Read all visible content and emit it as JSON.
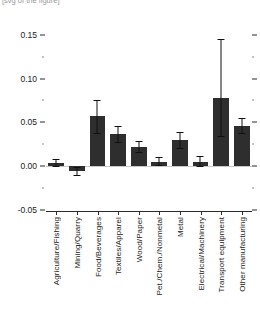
{
  "supertitle": "[svg of the figure]",
  "chart_data": {
    "type": "bar",
    "title": "",
    "xlabel": "",
    "ylabel": "",
    "ylim": [
      -0.05,
      0.16
    ],
    "grid": false,
    "legend": null,
    "orientation": "vertical",
    "error_bars": true,
    "baseline": 0.0,
    "categories": [
      "Agriculture/Fishing",
      "Mining/Quarry",
      "Food/Beverages",
      "Textiles/Apparel",
      "Wood/Paper",
      "Pet./Chem./Nonmetal",
      "Metal",
      "Electrical/Machinery",
      "Transport equipment",
      "Other manufacturing"
    ],
    "values": [
      0.004,
      -0.005,
      0.057,
      0.037,
      0.022,
      0.005,
      0.03,
      0.005,
      0.078,
      0.046
    ],
    "err_low": [
      0.0,
      -0.01,
      0.038,
      0.028,
      0.016,
      0.001,
      0.021,
      0.0,
      0.035,
      0.038
    ],
    "err_high": [
      0.008,
      -0.001,
      0.075,
      0.046,
      0.029,
      0.01,
      0.039,
      0.012,
      0.145,
      0.055
    ],
    "yticks_major": [
      -0.05,
      0.0,
      0.05,
      0.1,
      0.15
    ],
    "yticks_major_labels": [
      "-0.05",
      "0.00",
      "0.05",
      "0.10",
      "0.15"
    ],
    "yticks_minor": [
      -0.025,
      0.025,
      0.075,
      0.125
    ],
    "bar_color": "#2e2e2e",
    "error_color": "#101010",
    "axis_color": "#2b2b2b",
    "zeroline_color": "#c9c9c9"
  }
}
